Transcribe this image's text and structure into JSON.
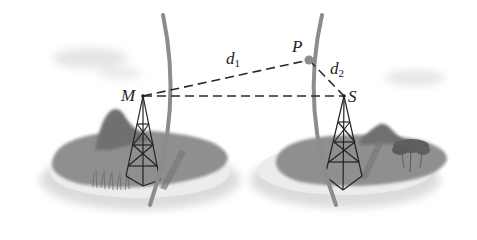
{
  "diagram": {
    "labels": {
      "M": "M",
      "P": "P",
      "S": "S",
      "d1_main": "d",
      "d1_sub": "1",
      "d2_main": "d",
      "d2_sub": "2"
    },
    "points": {
      "M": [
        143,
        96
      ],
      "P": [
        309,
        60
      ],
      "S": [
        344,
        96
      ]
    },
    "segments": [
      {
        "from": "M",
        "to": "P",
        "label": "d1",
        "style": "dashed"
      },
      {
        "from": "P",
        "to": "S",
        "label": "d2",
        "style": "dashed"
      },
      {
        "from": "M",
        "to": "S",
        "style": "dashed"
      }
    ],
    "elements": [
      "left island with mountain, grass and lattice tower M",
      "right island with mountain, tree and lattice tower S",
      "two curved wavefront arcs",
      "clouds"
    ],
    "colors": {
      "island": "#8a8a8a",
      "island_edge": "#e6e6e6",
      "arc": "#8c8c8c",
      "line": "#2a2a2a",
      "mountain": "#6e6e6e"
    }
  }
}
